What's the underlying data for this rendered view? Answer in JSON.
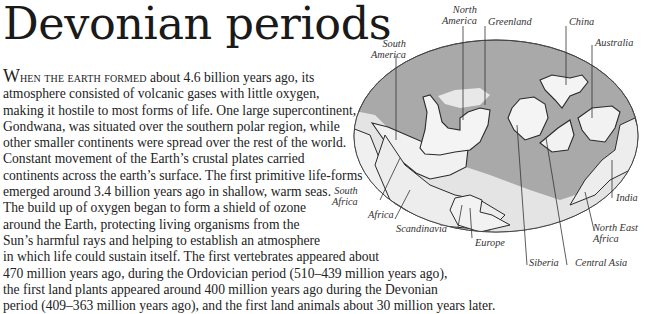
{
  "page": {
    "title": "Devonian periods",
    "body": {
      "lead_initial": "W",
      "lead_caps": "hen the earth formed",
      "lines": [
        " about 4.6 billion years ago, its",
        "atmosphere consisted of volcanic gases with little oxygen,",
        "making it hostile to most forms of life. One large supercontinent,",
        "Gondwana, was situated over the southern polar region, while",
        "other smaller continents were spread over the rest of the world.",
        "Constant movement of the Earth’s crustal plates carried",
        "continents across the earth’s surface. The first primitive life-forms",
        "emerged around 3.4 billion years ago in shallow, warm seas.",
        "The build up of oxygen began to form a shield of ozone",
        "around the Earth, protecting living organisms from the",
        "Sun’s harmful rays and helping to establish an atmosphere",
        "in which life could sustain itself. The first vertebrates appeared about",
        "470 million years ago, during the Ordovician period (510–439 million years ago),",
        "the first land plants appeared around 400 million years ago during the Devonian",
        "period (409–363 million years ago), and the first land animals about 30 million years later."
      ]
    },
    "map": {
      "ocean_color": "#a9a9a9",
      "land_color": "#f2f2f2",
      "shelf_color": "#dcdcdc",
      "outline_color": "#2a2a2a",
      "labels": {
        "north_america": [
          "North",
          "America"
        ],
        "greenland": "Greenland",
        "china": "China",
        "south_america": [
          "South",
          "America"
        ],
        "australia": "Australia",
        "south_africa": [
          "South",
          "Africa"
        ],
        "africa": "Africa",
        "scandinavia": "Scandinavia",
        "europe": "Europe",
        "siberia": "Siberia",
        "central_asia": "Central Asia",
        "india": "India",
        "north_east_africa": [
          "North East",
          "Africa"
        ]
      }
    }
  }
}
